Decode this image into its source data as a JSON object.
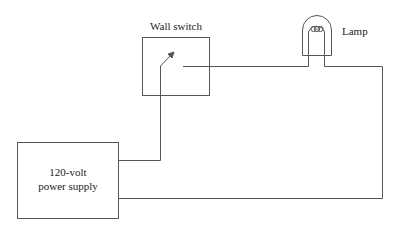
{
  "diagram": {
    "type": "electrical-circuit",
    "components": {
      "switch": {
        "label": "Wall switch"
      },
      "lamp": {
        "label": "Lamp"
      },
      "power_supply": {
        "label_line1": "120-volt",
        "label_line2": "power supply"
      }
    },
    "colors": {
      "line": "#555555",
      "text": "#222222",
      "background": "#ffffff"
    }
  }
}
